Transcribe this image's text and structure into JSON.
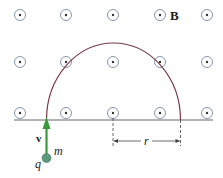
{
  "diagram": {
    "field_label": "B",
    "velocity_label": "v",
    "mass_label": "m",
    "charge_label": "q",
    "radius_label": "r",
    "field_symbol": "out-of-page-dot-icon",
    "colors": {
      "field_marker": "#5a6a8a",
      "trajectory": "#7a3a4a",
      "velocity_arrow": "#3a9a3a",
      "particle": "#5a9a7a",
      "baseline": "#555555"
    },
    "field_grid": {
      "columns_x": [
        20,
        66,
        113,
        160,
        207
      ],
      "rows_y": [
        15,
        62,
        113
      ]
    }
  }
}
